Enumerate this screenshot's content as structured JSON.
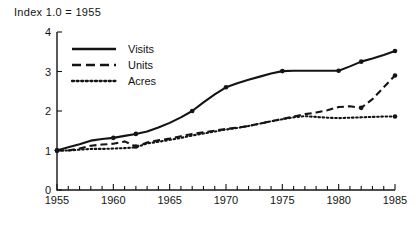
{
  "caption": "Index 1.0  =  1955",
  "legend": {
    "position": "top-left-inside",
    "items": [
      {
        "label": "Visits",
        "style": "solid",
        "key": "visits"
      },
      {
        "label": "Units",
        "style": "dashed",
        "key": "units"
      },
      {
        "label": "Acres",
        "style": "dotted",
        "key": "acres"
      }
    ]
  },
  "axes": {
    "y_ticks": [
      "0",
      "1",
      "2",
      "3",
      "4"
    ],
    "x_ticks": [
      "1955",
      "1960",
      "1965",
      "1970",
      "1975",
      "1980",
      "1985"
    ]
  },
  "colors": {
    "ink": "#141414",
    "background": "#ffffff"
  },
  "chart_data": {
    "type": "line",
    "title": "Index 1.0  =  1955",
    "xlabel": "",
    "ylabel": "",
    "xlim": [
      1955,
      1985
    ],
    "ylim": [
      0,
      4
    ],
    "grid": false,
    "legend_position": "upper left (inside plot)",
    "x": [
      1955,
      1956,
      1957,
      1958,
      1959,
      1960,
      1961,
      1962,
      1963,
      1964,
      1965,
      1966,
      1967,
      1968,
      1969,
      1970,
      1971,
      1972,
      1973,
      1974,
      1975,
      1976,
      1977,
      1978,
      1979,
      1980,
      1981,
      1982,
      1983,
      1984,
      1985
    ],
    "series": [
      {
        "name": "Visits",
        "style": "solid",
        "values": [
          1.0,
          1.08,
          1.16,
          1.25,
          1.29,
          1.32,
          1.37,
          1.42,
          1.48,
          1.58,
          1.7,
          1.84,
          2.0,
          2.22,
          2.42,
          2.6,
          2.7,
          2.79,
          2.87,
          2.95,
          3.01,
          3.02,
          3.02,
          3.02,
          3.02,
          3.02,
          3.13,
          3.25,
          3.33,
          3.42,
          3.52
        ]
      },
      {
        "name": "Units",
        "style": "dashed",
        "values": [
          1.0,
          1.0,
          1.05,
          1.12,
          1.15,
          1.17,
          1.23,
          1.1,
          1.2,
          1.26,
          1.3,
          1.36,
          1.42,
          1.46,
          1.5,
          1.55,
          1.58,
          1.62,
          1.68,
          1.74,
          1.8,
          1.86,
          1.92,
          1.96,
          2.02,
          2.1,
          2.12,
          2.08,
          2.3,
          2.6,
          2.9
        ]
      },
      {
        "name": "Acres",
        "style": "dotted",
        "values": [
          1.0,
          1.0,
          1.02,
          1.04,
          1.04,
          1.05,
          1.06,
          1.08,
          1.18,
          1.22,
          1.27,
          1.32,
          1.38,
          1.43,
          1.48,
          1.53,
          1.57,
          1.62,
          1.68,
          1.74,
          1.79,
          1.84,
          1.87,
          1.85,
          1.83,
          1.82,
          1.83,
          1.84,
          1.85,
          1.86,
          1.86
        ]
      }
    ],
    "markers": {
      "Visits": [
        1955,
        1960,
        1962,
        1967,
        1970,
        1975,
        1980,
        1982,
        1985
      ],
      "Units": [
        1955,
        1962,
        1982,
        1985
      ],
      "Acres": [
        1955,
        1985
      ]
    }
  }
}
